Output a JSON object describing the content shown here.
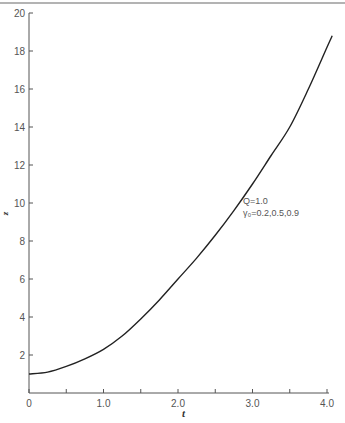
{
  "chart_data": {
    "type": "line",
    "title": "",
    "xlabel": "t",
    "ylabel": "z",
    "xlim": [
      0,
      4.0
    ],
    "ylim": [
      0,
      20
    ],
    "grid": false,
    "x_ticks": [
      "0",
      "1.0",
      "2.0",
      "3.0",
      "4.0"
    ],
    "x_tick_values": [
      0,
      1.0,
      2.0,
      3.0,
      4.0
    ],
    "x_minor_ticks": [
      0.5,
      1.5,
      2.5,
      3.5
    ],
    "y_ticks": [
      "2",
      "4",
      "6",
      "8",
      "10",
      "12",
      "14",
      "16",
      "18",
      "20"
    ],
    "y_tick_values": [
      2,
      4,
      6,
      8,
      10,
      12,
      14,
      16,
      18,
      20
    ],
    "series": [
      {
        "name": "z(t)",
        "x": [
          0,
          0.25,
          0.5,
          0.75,
          1.0,
          1.25,
          1.5,
          1.75,
          2.0,
          2.25,
          2.5,
          2.75,
          3.0,
          3.25,
          3.5,
          3.75,
          4.0,
          4.07
        ],
        "values": [
          1.0,
          1.1,
          1.4,
          1.8,
          2.3,
          3.0,
          3.9,
          4.9,
          6.0,
          7.1,
          8.3,
          9.6,
          11.0,
          12.5,
          14.0,
          16.0,
          18.2,
          18.8
        ]
      }
    ],
    "annotations": [
      {
        "text": "Q=1.0",
        "x": 2.9,
        "y": 11.1
      },
      {
        "text": "γ₀=0.2,0.5,0.9",
        "x": 2.9,
        "y": 10.3
      }
    ],
    "legend": null
  }
}
